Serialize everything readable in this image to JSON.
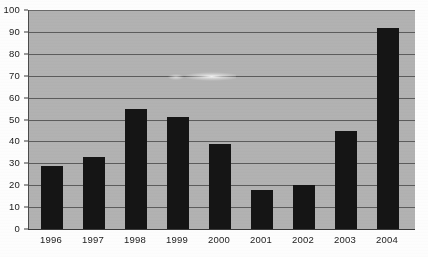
{
  "chart_data": {
    "type": "bar",
    "title": "",
    "xlabel": "",
    "ylabel": "",
    "categories": [
      "1996",
      "1997",
      "1998",
      "1999",
      "2000",
      "2001",
      "2002",
      "2003",
      "2004"
    ],
    "values": [
      29,
      33,
      55,
      51,
      39,
      18,
      20,
      45,
      92
    ],
    "ylim": [
      0,
      100
    ],
    "y_ticks": [
      0,
      10,
      20,
      30,
      40,
      50,
      60,
      70,
      80,
      90,
      100
    ],
    "grid": true,
    "legend": null,
    "legend_position": "none",
    "annotations": [],
    "colors": {
      "bar": "#151515",
      "plot_background": "#b2b2b2",
      "gridline": "#5c5c5c",
      "axis": "#3a3a3a",
      "figure_background": "#fdfdfd",
      "text": "#1a1a1a"
    }
  }
}
